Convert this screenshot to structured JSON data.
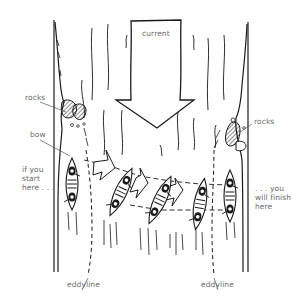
{
  "diagram": {
    "labels": {
      "current": "current",
      "rocks_left": "rocks",
      "rocks_right": "rocks",
      "bow": "bow",
      "start": "if you\nstart\nhere . . .",
      "finish": ". . . you\nwill finish\nhere",
      "eddyline_left": "eddyline",
      "eddyline_right": "eddyline"
    },
    "elements": [
      {
        "id": "left-bank",
        "type": "riverbank"
      },
      {
        "id": "right-bank",
        "type": "riverbank"
      },
      {
        "id": "current-arrow",
        "type": "arrow",
        "direction": "down"
      },
      {
        "id": "rocks-left",
        "type": "rocks"
      },
      {
        "id": "rocks-right",
        "type": "rocks"
      },
      {
        "id": "canoe-1",
        "type": "canoe",
        "position": "start, left eddy"
      },
      {
        "id": "canoe-2",
        "type": "canoe",
        "position": "ferry angle"
      },
      {
        "id": "canoe-3",
        "type": "canoe",
        "position": "ferry angle"
      },
      {
        "id": "canoe-4",
        "type": "canoe",
        "position": "crossing right eddyline"
      },
      {
        "id": "canoe-5",
        "type": "canoe",
        "position": "finish, right eddy"
      },
      {
        "id": "eddyline-left",
        "type": "dashed-line"
      },
      {
        "id": "eddyline-right",
        "type": "dashed-line"
      }
    ],
    "colors": {
      "ink": "#1a1a1a",
      "label": "#6a6a6a",
      "background": "#ffffff"
    }
  }
}
